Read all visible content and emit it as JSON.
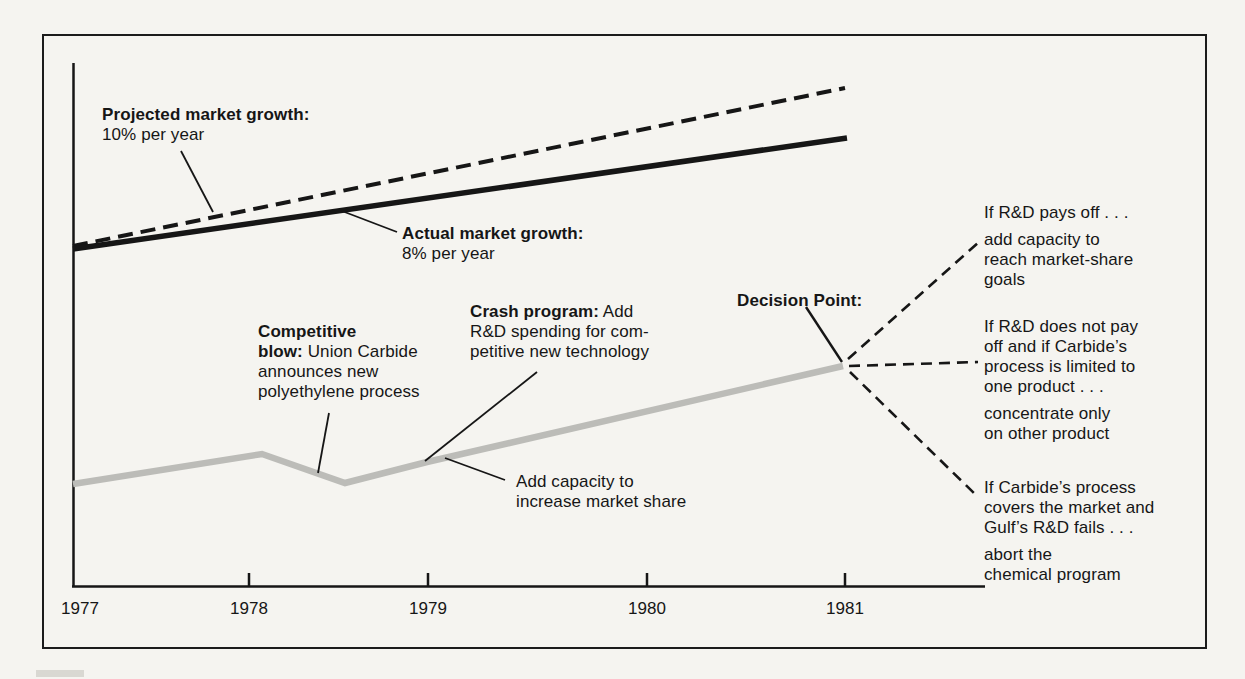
{
  "page": {
    "background": "#f5f4f0",
    "ink": "#161616",
    "gray_line_color": "#bcbcb8"
  },
  "chart_data": {
    "type": "line",
    "title": "",
    "xlabel": "",
    "ylabel": "",
    "x_ticks": [
      "1977",
      "1978",
      "1979",
      "1980",
      "1981"
    ],
    "grid": false,
    "legend_position": "inline annotations with leader lines",
    "ylim": [
      0,
      100
    ],
    "series": [
      {
        "name": "Projected market growth",
        "rate": "10% per year",
        "style": "dashed",
        "color": "#161616",
        "x": [
          1977,
          1981
        ],
        "values": [
          65,
          95
        ]
      },
      {
        "name": "Actual market growth",
        "rate": "8% per year",
        "style": "solid",
        "color": "#161616",
        "x": [
          1977,
          1981
        ],
        "values": [
          65,
          86
        ]
      },
      {
        "name": "Company performance (gray)",
        "style": "solid",
        "color": "#bcbcb8",
        "x": [
          1977,
          1978.1,
          1978.5,
          1979,
          1981
        ],
        "values": [
          19.5,
          25.5,
          19.8,
          23.8,
          42
        ]
      }
    ],
    "events": [
      {
        "year": 1978.5,
        "label": "Competitive blow:",
        "text": "Union Carbide announces new polyethylene process"
      },
      {
        "year": 1979,
        "label": "Crash program:",
        "text": "Add R&D spending for competitive new technology"
      },
      {
        "year": 1979.1,
        "label": "",
        "text": "Add capacity to increase market share"
      }
    ],
    "decision_point": {
      "label": "Decision Point:",
      "year": 1981,
      "branches": [
        {
          "condition": "If R&D pays off . . .",
          "action": "add capacity to reach market-share goals"
        },
        {
          "condition": "If R&D does not pay off and if Carbide’s process is limited to one product . . .",
          "action": "concentrate only on other product"
        },
        {
          "condition": "If Carbide’s process covers the market and Gulf’s R&D fails . . .",
          "action": "abort the chemical program"
        }
      ]
    }
  },
  "labels": {
    "projected": [
      {
        "b": "Projected market growth:"
      },
      {
        "t": "10% per year"
      }
    ],
    "actual": [
      {
        "b": "Actual market growth:"
      },
      {
        "t": "8% per year"
      }
    ],
    "competitive": [
      {
        "b": "Competitive"
      },
      {
        "b": "blow:",
        "t": " Union Carbide"
      },
      {
        "t": "announces new"
      },
      {
        "t": "polyethylene process"
      }
    ],
    "crash": [
      {
        "b": "Crash program:",
        "t": " Add"
      },
      {
        "t": "R&D spending for com-"
      },
      {
        "t": "petitive new technology"
      }
    ],
    "add_capacity": [
      {
        "t": "Add capacity to"
      },
      {
        "t": "increase market share"
      }
    ],
    "decision": [
      {
        "b": "Decision Point:"
      }
    ],
    "branch_top": [
      {
        "t": "If R&D pays off . . ."
      },
      {
        "t": "add capacity to",
        "gap": true
      },
      {
        "t": "reach market-share"
      },
      {
        "t": "goals"
      }
    ],
    "branch_middle": [
      {
        "t": "If R&D does not pay"
      },
      {
        "t": "off and if Carbide’s"
      },
      {
        "t": "process is limited to"
      },
      {
        "t": "one product . . ."
      },
      {
        "t": "concentrate only",
        "gap": true
      },
      {
        "t": "on other product"
      }
    ],
    "branch_bottom": [
      {
        "t": "If Carbide’s process"
      },
      {
        "t": "covers the market and"
      },
      {
        "t": "Gulf’s R&D fails . . ."
      },
      {
        "t": "abort the",
        "gap": true
      },
      {
        "t": "chemical program"
      }
    ]
  },
  "render_px": {
    "tick_label_x": [
      80,
      249,
      428,
      647,
      845
    ],
    "tick_label_y": 614,
    "lines": [
      {
        "name": "y-axis",
        "pts": [
          [
            73.5,
            63
          ],
          [
            73.5,
            587
          ]
        ],
        "w": 2.5,
        "color": "#161616"
      },
      {
        "name": "x-axis",
        "pts": [
          [
            72,
            586.5
          ],
          [
            985,
            586.5
          ]
        ],
        "w": 2.5,
        "color": "#161616"
      },
      {
        "name": "tick-1978",
        "pts": [
          [
            249,
            573
          ],
          [
            249,
            586
          ]
        ],
        "w": 2.5,
        "color": "#161616"
      },
      {
        "name": "tick-1979",
        "pts": [
          [
            428,
            573
          ],
          [
            428,
            586
          ]
        ],
        "w": 2.5,
        "color": "#161616"
      },
      {
        "name": "tick-1980",
        "pts": [
          [
            647,
            573
          ],
          [
            647,
            586
          ]
        ],
        "w": 2.5,
        "color": "#161616"
      },
      {
        "name": "tick-1981",
        "pts": [
          [
            845,
            573
          ],
          [
            845,
            586
          ]
        ],
        "w": 2.5,
        "color": "#161616"
      },
      {
        "name": "projected-growth-line",
        "pts": [
          [
            73,
            246
          ],
          [
            845,
            88
          ]
        ],
        "w": 4,
        "color": "#161616",
        "dash": "15 8"
      },
      {
        "name": "actual-growth-line",
        "pts": [
          [
            73,
            249
          ],
          [
            847,
            138
          ]
        ],
        "w": 5.5,
        "color": "#161616"
      },
      {
        "name": "performance-line",
        "pts": [
          [
            73,
            484
          ],
          [
            262,
            454
          ],
          [
            345,
            483
          ],
          [
            427,
            462
          ],
          [
            843,
            366
          ]
        ],
        "w": 6.5,
        "color": "#bcbcb8"
      },
      {
        "name": "projected-leader",
        "pts": [
          [
            181,
            151
          ],
          [
            213,
            212
          ]
        ],
        "w": 1.8,
        "color": "#161616"
      },
      {
        "name": "actual-leader",
        "pts": [
          [
            342,
            211
          ],
          [
            397,
            232
          ]
        ],
        "w": 1.8,
        "color": "#161616"
      },
      {
        "name": "competitive-leader",
        "pts": [
          [
            329,
            413
          ],
          [
            318,
            473
          ]
        ],
        "w": 1.8,
        "color": "#161616"
      },
      {
        "name": "crash-leader",
        "pts": [
          [
            537,
            372
          ],
          [
            425,
            461
          ]
        ],
        "w": 1.8,
        "color": "#161616"
      },
      {
        "name": "add-capacity-leader",
        "pts": [
          [
            505,
            480
          ],
          [
            445,
            458
          ]
        ],
        "w": 1.8,
        "color": "#161616"
      },
      {
        "name": "decision-leader",
        "pts": [
          [
            806,
            307
          ],
          [
            842,
            362
          ]
        ],
        "w": 2.4,
        "color": "#161616"
      },
      {
        "name": "branch-top-dashed",
        "pts": [
          [
            848,
            359
          ],
          [
            979,
            242
          ]
        ],
        "w": 2.6,
        "color": "#161616",
        "dash": "11 7"
      },
      {
        "name": "branch-middle-dashed",
        "pts": [
          [
            849,
            366
          ],
          [
            978,
            362
          ]
        ],
        "w": 2.6,
        "color": "#161616",
        "dash": "11 7"
      },
      {
        "name": "branch-bottom-dashed",
        "pts": [
          [
            850,
            372
          ],
          [
            978,
            497
          ]
        ],
        "w": 2.6,
        "color": "#161616",
        "dash": "11 7"
      }
    ]
  }
}
